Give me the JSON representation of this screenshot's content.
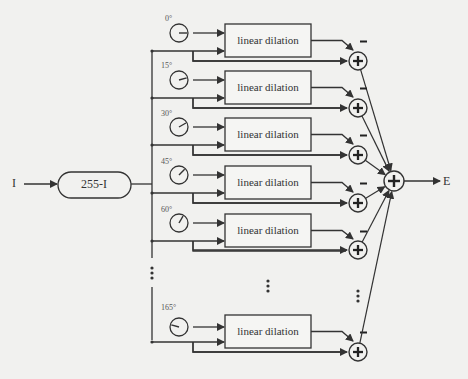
{
  "diagram": {
    "input_label": "I",
    "output_label": "E",
    "invert_block_label": "255-I",
    "rows": [
      {
        "angle": "0°",
        "block_label": "linear dilation",
        "minus_sign": "−",
        "plus_sign": "+"
      },
      {
        "angle": "15°",
        "block_label": "linear dilation",
        "minus_sign": "−",
        "plus_sign": "+"
      },
      {
        "angle": "30°",
        "block_label": "linear dilation",
        "minus_sign": "−",
        "plus_sign": "+"
      },
      {
        "angle": "45°",
        "block_label": "linear dilation",
        "minus_sign": "−",
        "plus_sign": "+"
      },
      {
        "angle": "60°",
        "block_label": "linear dilation",
        "minus_sign": "−",
        "plus_sign": "+"
      },
      {
        "angle": "165°",
        "block_label": "linear dilation",
        "minus_sign": "−",
        "plus_sign": "+"
      }
    ],
    "ellipsis": "⋮",
    "final_sum_sign": "+",
    "colors": {
      "line": "#333333",
      "background": "#f1f1ef",
      "angle_text": "#555555"
    }
  }
}
